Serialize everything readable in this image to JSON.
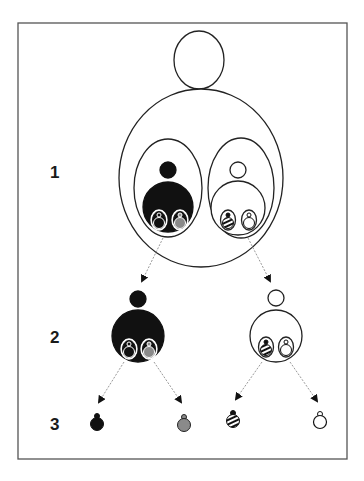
{
  "diagram": {
    "type": "hierarchical nesting diagram",
    "levels": [
      {
        "label": "1",
        "description": "Parent figure containing two nested sub-figures"
      },
      {
        "label": "2",
        "description": "Two separated sub-figures, each containing two ornaments"
      },
      {
        "label": "3",
        "description": "Four individual ornaments"
      }
    ],
    "level3_items": [
      {
        "name": "black-ornament",
        "fill": "#111111"
      },
      {
        "name": "gray-ornament",
        "fill": "#888888"
      },
      {
        "name": "striped-ornament",
        "fill": "striped"
      },
      {
        "name": "white-ornament",
        "fill": "#ffffff"
      }
    ],
    "colors": {
      "stroke": "#222222",
      "black": "#111111",
      "gray": "#8a8a8a",
      "arrow": "#9a9a9a",
      "frame": "#555555"
    }
  }
}
